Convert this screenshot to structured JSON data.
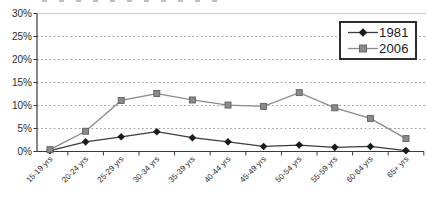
{
  "chart_data": {
    "type": "line",
    "title": "",
    "categories": [
      "15-19 yrs",
      "20-24 yrs",
      "25-29 yrs",
      "30-34 yrs",
      "35-39 yrs",
      "40-44 yrs",
      "45-49 yrs",
      "50-54 yrs",
      "55-59 yrs",
      "60-64 yrs",
      "65+ yrs"
    ],
    "series": [
      {
        "name": "1981",
        "marker": "diamond",
        "color": "#1a1a1a",
        "line_color": "#3c3c3c",
        "border_color": "#1a1a1a",
        "values": [
          0.2,
          2.1,
          3.2,
          4.3,
          3.0,
          2.1,
          1.1,
          1.4,
          0.9,
          1.1,
          0.2
        ]
      },
      {
        "name": "2006",
        "marker": "square",
        "color": "#8a8a8a",
        "line_color": "#8a8a8a",
        "border_color": "#5f5f5f",
        "values": [
          0.4,
          4.4,
          11.1,
          12.6,
          11.2,
          10.1,
          9.8,
          12.8,
          9.5,
          7.2,
          2.8
        ]
      }
    ],
    "xlabel": "",
    "ylabel": "",
    "ylim": [
      0,
      30
    ],
    "ytick_step": 5,
    "ytick_labels": [
      "0%",
      "5%",
      "10%",
      "15%",
      "20%",
      "25%",
      "30%"
    ],
    "grid": {
      "horizontal": true,
      "style": "dotted",
      "color": "#999999",
      "top_border_color": "#c9c9c9"
    },
    "axis_color": "#3a3a3a",
    "legend": {
      "position": "top-right",
      "items": [
        "1981",
        "2006"
      ]
    }
  }
}
